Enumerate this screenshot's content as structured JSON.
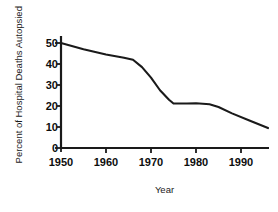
{
  "chart_data": {
    "type": "line",
    "title": "",
    "xlabel": "Year",
    "ylabel": "Percent of Hospital Deaths Autopsied",
    "xlim": [
      1950,
      1996
    ],
    "ylim": [
      0,
      52
    ],
    "grid": false,
    "legend": null,
    "xticks": [
      1950,
      1960,
      1970,
      1980,
      1990
    ],
    "xtick_labels": [
      "1950",
      "1960",
      "1970",
      "1980",
      "1990"
    ],
    "yticks": [
      0,
      10,
      20,
      30,
      40,
      50
    ],
    "ytick_labels": [
      "0",
      "10",
      "20",
      "30",
      "40",
      "50"
    ],
    "line_color": "#1a1a1a",
    "line_width": 2,
    "series": [
      {
        "name": "Percent of Hospital Deaths Autopsied",
        "x": [
          1950,
          1955,
          1960,
          1964,
          1966,
          1968,
          1970,
          1972,
          1974,
          1975,
          1978,
          1980,
          1983,
          1985,
          1988,
          1992,
          1996
        ],
        "values": [
          50.0,
          47.0,
          44.5,
          43.0,
          42.0,
          38.5,
          33.5,
          27.5,
          23.0,
          21.2,
          21.2,
          21.3,
          20.8,
          19.5,
          16.5,
          13.0,
          9.5
        ]
      }
    ]
  },
  "axis": {
    "ylabel_text": "Percent of Hospital Deaths Autopsied",
    "xlabel_text": "Year"
  }
}
